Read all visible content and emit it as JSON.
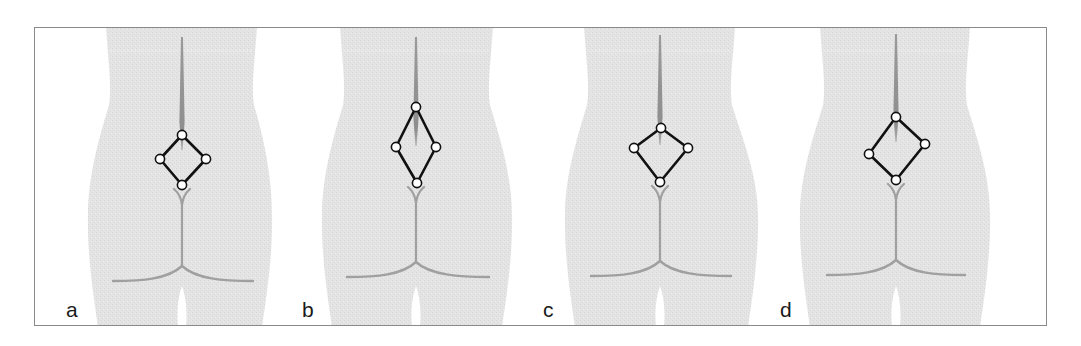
{
  "figure": {
    "colors": {
      "background": "#ffffff",
      "frame": "#8a8a8a",
      "body_fill": "#e4e4e4",
      "body_texture": "#d8d8d8",
      "spine": "#9a9a9a",
      "waist_dots": "#f4f4f4",
      "fold": "#a0a0a0",
      "diamond_stroke": "#111111",
      "landmark_fill": "#ffffff"
    },
    "panels": [
      {
        "label": "a",
        "center_x": 182,
        "label_x": 66,
        "diamond": {
          "top": [
            182,
            135
          ],
          "right": [
            206,
            159
          ],
          "bottom": [
            182,
            185
          ],
          "left": [
            160,
            159
          ]
        },
        "spine_top": 37,
        "spine_bottom": 150,
        "waist": [
          106,
          257
        ],
        "hips": [
          88,
          272
        ],
        "fold_y": 280,
        "fold_span": [
          113,
          253
        ]
      },
      {
        "label": "b",
        "center_x": 416,
        "label_x": 302,
        "diamond": {
          "top": [
            416,
            107
          ],
          "right": [
            436,
            147
          ],
          "bottom": [
            417,
            183
          ],
          "left": [
            396,
            147
          ]
        },
        "spine_top": 37,
        "spine_bottom": 146,
        "waist": [
          340,
          493
        ],
        "hips": [
          322,
          512
        ],
        "fold_y": 276,
        "fold_span": [
          347,
          489
        ]
      },
      {
        "label": "c",
        "center_x": 660,
        "label_x": 543,
        "diamond": {
          "top": [
            661,
            128
          ],
          "right": [
            688,
            148
          ],
          "bottom": [
            660,
            182
          ],
          "left": [
            634,
            148
          ]
        },
        "spine_top": 35,
        "spine_bottom": 145,
        "waist": [
          584,
          735
        ],
        "hips": [
          565,
          758
        ],
        "fold_y": 275,
        "fold_span": [
          591,
          731
        ]
      },
      {
        "label": "d",
        "center_x": 896,
        "label_x": 780,
        "diamond": {
          "top": [
            896,
            117
          ],
          "right": [
            925,
            144
          ],
          "bottom": [
            896,
            180
          ],
          "left": [
            869,
            154
          ]
        },
        "spine_top": 34,
        "spine_bottom": 142,
        "waist": [
          820,
          970
        ],
        "hips": [
          800,
          990
        ],
        "fold_y": 274,
        "fold_span": [
          827,
          965
        ]
      }
    ],
    "frame": {
      "x": 34,
      "y": 27,
      "width": 1013,
      "height": 299
    }
  }
}
